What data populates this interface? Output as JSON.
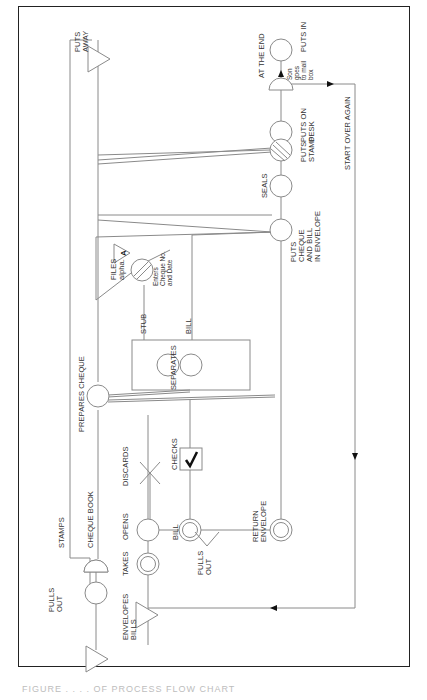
{
  "diagram": {
    "orientation": "rotated-90-ccw",
    "line_color": "#8a8a8a",
    "frame_color": "#222222",
    "labels": {
      "pulls_out_1": [
        "PULLS",
        "OUT"
      ],
      "envelopes_bills": [
        "ENVELOPES",
        "BILLS"
      ],
      "stamps": "STAMPS",
      "cheque_book": "CHEQUE BOOK",
      "takes": "TAKES",
      "opens": "OPENS",
      "pulls_out_2": [
        "PULLS",
        "OUT"
      ],
      "discards": "DISCARDS",
      "bill_1": "BILL",
      "checks": "CHECKS",
      "return_envelope": [
        "RETURN",
        "ENVELOPE"
      ],
      "prepares_cheque": "PREPARES CHEQUE",
      "separates": "SEPARATES",
      "stub": "STUB",
      "bill_2": "BILL",
      "enters": [
        "Enters",
        "Cheque No.",
        "and Date"
      ],
      "files": [
        "FILES",
        "alpha."
      ],
      "file_marker": "A",
      "puts_cheque": [
        "PUTS",
        "CHEQUE",
        "AND BILL",
        "IN ENVELOPE"
      ],
      "seals": "SEALS",
      "puts_stamp": [
        "PUTS",
        "STAMP"
      ],
      "puts_on_desk": [
        "PUTS ON",
        "DESK"
      ],
      "at_the_end": "AT THE END",
      "son_goes": [
        "Son",
        "goes",
        "to mail",
        "box"
      ],
      "puts_in": "PUTS IN",
      "puts_away": [
        "PUTS",
        "AWAY"
      ],
      "start_over": "START OVER AGAIN"
    }
  },
  "caption": "FIGURE . . . . OF PROCESS FLOW CHART"
}
